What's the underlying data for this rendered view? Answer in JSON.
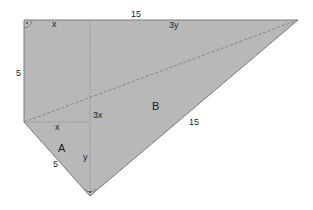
{
  "diagram": {
    "fill_color": "#b8b8b8",
    "edge_color": "#777777",
    "guide_color": "#888888",
    "vertices": {
      "top_left": [
        24,
        20
      ],
      "top_right": [
        298,
        20
      ],
      "left_mid": [
        24,
        122
      ],
      "bottom": [
        90,
        196
      ]
    },
    "regions": {
      "A": "A",
      "B": "B"
    },
    "labels": {
      "top_x": "x",
      "top_15": "15",
      "top_3y": "3y",
      "left_5": "5",
      "mid_3x": "3x",
      "mid_x": "x",
      "region_A": "A",
      "region_B": "B",
      "lower_5": "5",
      "lower_y": "y",
      "hyp_15": "15"
    },
    "right_angle_markers": [
      "top-left corner",
      "bottom vertex"
    ]
  }
}
